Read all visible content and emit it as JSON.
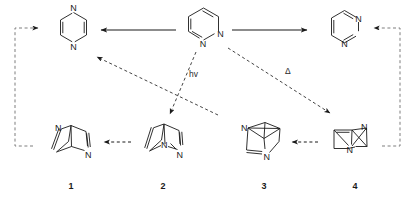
{
  "diagram": {
    "type": "chemical-reaction-scheme"
  },
  "colors": {
    "line": "#1a1a1a",
    "dashed": "#555555",
    "background": "#ffffff",
    "text": "#1a1a1a"
  },
  "molecules": {
    "pyrazine": {
      "name": "pyrazine",
      "position": "top-left",
      "atom_labels": [
        "N",
        "N"
      ]
    },
    "pyridazine": {
      "name": "pyridazine",
      "position": "top-center",
      "atom_labels": [
        "N",
        "N"
      ]
    },
    "pyrimidine": {
      "name": "pyrimidine",
      "position": "top-right",
      "atom_labels": [
        "N",
        "N"
      ]
    },
    "dewar_pyrazine": {
      "name": "Dewar pyrazine",
      "label": "1",
      "position": "bottom-1",
      "atom_labels": [
        "N",
        "N"
      ]
    },
    "dewar_pyridazine": {
      "name": "Dewar pyridazine",
      "label": "2",
      "position": "bottom-2",
      "atom_labels": [
        "N",
        "N"
      ]
    },
    "diazabenzvalene_a": {
      "name": "diazabenzvalene",
      "label": "3",
      "position": "bottom-3",
      "atom_labels": [
        "N",
        "N"
      ]
    },
    "diazabenzvalene_b": {
      "name": "diazabenzvalene isomer",
      "label": "4",
      "position": "bottom-4",
      "atom_labels": [
        "N",
        "N"
      ]
    }
  },
  "labels": {
    "struct_1": "1",
    "struct_2": "2",
    "struct_3": "3",
    "struct_4": "4"
  },
  "conditions": {
    "photochemical": "hv",
    "thermal": "Δ"
  },
  "atoms": {
    "nitrogen": "N"
  },
  "arrows": [
    {
      "id": "pyridazine-to-pyrazine",
      "style": "solid",
      "direction": "left"
    },
    {
      "id": "pyridazine-to-pyrimidine",
      "style": "solid",
      "direction": "right"
    },
    {
      "id": "pyridazine-to-2-hv",
      "style": "dashed",
      "direction": "down",
      "label": "hv"
    },
    {
      "id": "pyridazine-to-4-delta",
      "style": "dashed",
      "direction": "down-right",
      "label": "Δ"
    },
    {
      "id": "cross-to-pyrazine",
      "style": "dashed",
      "direction": "up-left"
    },
    {
      "id": "2-to-1",
      "style": "dashed",
      "direction": "left"
    },
    {
      "id": "4-to-3",
      "style": "dashed",
      "direction": "left"
    },
    {
      "id": "1-to-pyrazine-loop",
      "style": "dashed",
      "direction": "up-right"
    },
    {
      "id": "4-to-pyrimidine-loop",
      "style": "dashed",
      "direction": "up-left"
    }
  ]
}
